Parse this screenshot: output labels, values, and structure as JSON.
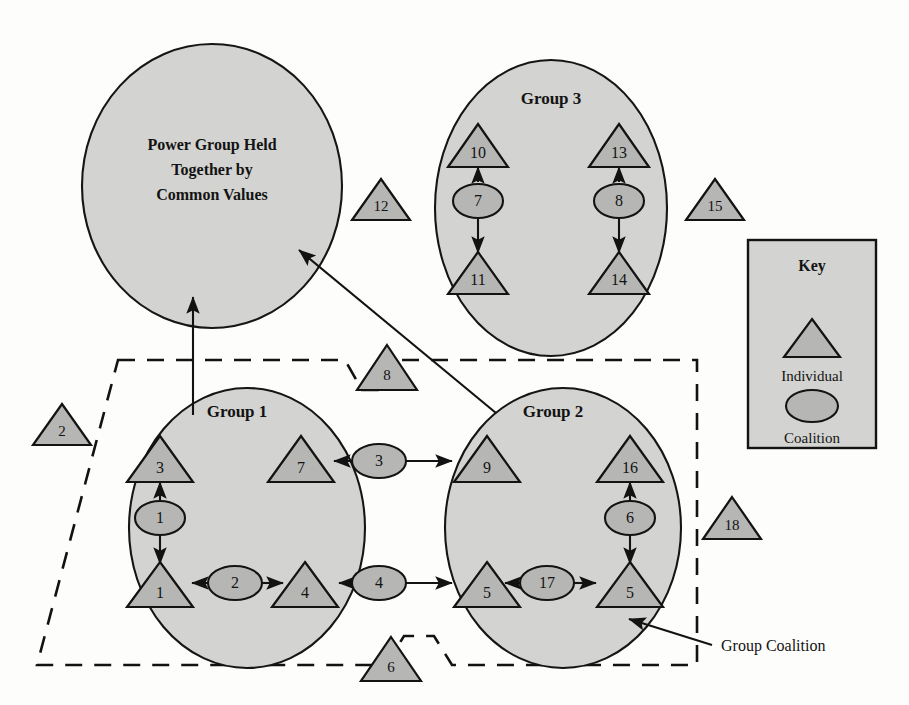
{
  "figure": {
    "title_in_power_group": [
      "Power Group Held",
      "Together by",
      "Common Values"
    ],
    "background_color": "#fdfdfb",
    "shape_fill": "#b6b6b4",
    "blob_fill": "#d3d3d1",
    "stroke_color": "#131313"
  },
  "power_group": {
    "label_line1": "Power Group Held",
    "label_line2": "Together by",
    "label_line3": "Common Values"
  },
  "groups": [
    {
      "id": "group1",
      "label": "Group 1",
      "individuals": [
        "3",
        "7",
        "1",
        "4"
      ],
      "coalitions": [
        "1",
        "2"
      ]
    },
    {
      "id": "group2",
      "label": "Group 2",
      "individuals": [
        "9",
        "16",
        "5",
        "17"
      ],
      "coalitions": [
        "6",
        "5"
      ]
    },
    {
      "id": "group3",
      "label": "Group 3",
      "individuals": [
        "10",
        "11",
        "13",
        "14"
      ],
      "coalitions": [
        "7",
        "8"
      ]
    }
  ],
  "nodes": {
    "g1_tri_top_left": "3",
    "g1_coal_left": "1",
    "g1_tri_bottom_left": "1",
    "g1_coal_bottom": "2",
    "g1_tri_bottom_right": "4",
    "g1_tri_top_right": "7",
    "g2_tri_top_left": "9",
    "g2_tri_top_right": "16",
    "g2_coal_right": "6",
    "g2_tri_bottom_right": "17",
    "g2_coal_bottom": "5",
    "g2_tri_bottom_left": "5",
    "g3_tri_top_left": "10",
    "g3_coal_left": "7",
    "g3_tri_bottom_left": "11",
    "g3_tri_top_right": "13",
    "g3_coal_right": "8",
    "g3_tri_bottom_right": "14",
    "bridge_coal_top": "3",
    "bridge_coal_bottom": "4",
    "outside_tri_left": "2",
    "outside_tri_mid_upper": "12",
    "outside_tri_right_upper": "15",
    "outside_tri_right_lower": "18",
    "outside_tri_top_notch": "8",
    "outside_tri_bottom_notch": "6"
  },
  "key": {
    "title": "Key",
    "individual_label": "Individual",
    "coalition_label": "Coalition"
  },
  "callouts": {
    "group_coalition": "Group Coalition"
  }
}
